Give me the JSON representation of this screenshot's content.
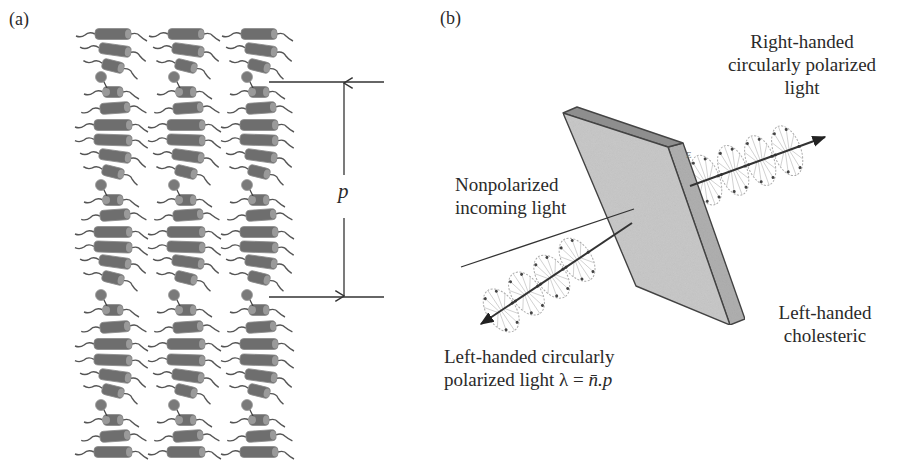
{
  "figure": {
    "panel_a": {
      "label": "(a)",
      "pitch_symbol": "p",
      "columns_x": [
        113,
        186,
        259
      ],
      "rows": [
        {
          "y": 34,
          "len": 36,
          "tilt": 0,
          "dot": false
        },
        {
          "y": 50,
          "len": 32,
          "tilt": 8,
          "dot": false
        },
        {
          "y": 66,
          "len": 22,
          "tilt": 14,
          "dot": false
        },
        {
          "y": 92,
          "len": 20,
          "tilt": 0,
          "dot": true
        },
        {
          "y": 108,
          "len": 30,
          "tilt": -4,
          "dot": false
        },
        {
          "y": 125,
          "len": 38,
          "tilt": 0,
          "dot": false
        },
        {
          "y": 140,
          "len": 38,
          "tilt": 2,
          "dot": false
        },
        {
          "y": 156,
          "len": 32,
          "tilt": 8,
          "dot": false
        },
        {
          "y": 172,
          "len": 22,
          "tilt": 14,
          "dot": false
        },
        {
          "y": 200,
          "len": 20,
          "tilt": 0,
          "dot": true
        },
        {
          "y": 215,
          "len": 30,
          "tilt": -4,
          "dot": false
        },
        {
          "y": 232,
          "len": 38,
          "tilt": 0,
          "dot": false
        },
        {
          "y": 247,
          "len": 38,
          "tilt": 2,
          "dot": false
        },
        {
          "y": 262,
          "len": 32,
          "tilt": 8,
          "dot": false
        },
        {
          "y": 278,
          "len": 22,
          "tilt": 14,
          "dot": false
        },
        {
          "y": 310,
          "len": 20,
          "tilt": 0,
          "dot": true
        },
        {
          "y": 327,
          "len": 30,
          "tilt": -4,
          "dot": false
        },
        {
          "y": 344,
          "len": 38,
          "tilt": 0,
          "dot": false
        },
        {
          "y": 360,
          "len": 38,
          "tilt": 2,
          "dot": false
        },
        {
          "y": 376,
          "len": 32,
          "tilt": 8,
          "dot": false
        },
        {
          "y": 391,
          "len": 22,
          "tilt": 14,
          "dot": false
        },
        {
          "y": 420,
          "len": 20,
          "tilt": 0,
          "dot": true
        },
        {
          "y": 436,
          "len": 30,
          "tilt": -4,
          "dot": false
        },
        {
          "y": 452,
          "len": 38,
          "tilt": 0,
          "dot": false
        }
      ],
      "pitch_marker": {
        "x": 344,
        "y_top": 82,
        "y_bottom": 297,
        "line_x1": 269,
        "line_x2": 384
      }
    },
    "panel_b": {
      "label": "(b)",
      "labels": {
        "reflected_line1": "Right-handed",
        "reflected_line2": "circularly polarized",
        "reflected_line3": "light",
        "incoming_line1": "Nonpolarized",
        "incoming_line2": "incoming light",
        "transmitted_line1": "Left-handed circularly",
        "transmitted_line2_prefix": "polarized light λ = ",
        "transmitted_line2_formula": "n̄.p",
        "sample_line1": "Left-handed",
        "sample_line2": "cholesteric",
        "field_symbol": "E"
      },
      "plate": {
        "front": [
          [
            563,
            113
          ],
          [
            668,
            147
          ],
          [
            730,
            325
          ],
          [
            636,
            286
          ]
        ],
        "top": [
          [
            563,
            113
          ],
          [
            577,
            107
          ],
          [
            683,
            143
          ],
          [
            668,
            147
          ]
        ],
        "side": [
          [
            668,
            147
          ],
          [
            683,
            143
          ],
          [
            745,
            319
          ],
          [
            730,
            325
          ]
        ],
        "colors": {
          "front": "#c9c9c9",
          "top": "#8e8e8e",
          "side": "#b0b0b0",
          "edge": "#444444"
        }
      },
      "incoming_ray": {
        "from": [
          461,
          267
        ],
        "to": [
          634,
          209
        ]
      },
      "transmitted_ray": {
        "from": [
          632,
          223
        ],
        "to": [
          481,
          324
        ]
      },
      "reflected_ray": {
        "from": [
          690,
          186
        ],
        "to": [
          825,
          137
        ]
      }
    }
  }
}
